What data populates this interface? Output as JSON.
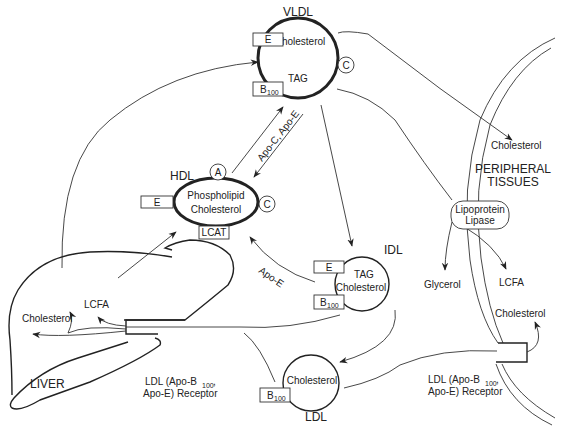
{
  "vldl": {
    "title": "VLDL",
    "content": [
      "Cholesterol",
      "TAG"
    ],
    "apo_boxes": [
      "E",
      "B",
      "100"
    ],
    "apo_circle": "C"
  },
  "hdl": {
    "title": "HDL",
    "content": [
      "Phospholipid",
      "Cholesterol"
    ],
    "apo_box_left": "E",
    "apo_box_bottom": "LCAT",
    "apo_circle_top": "A",
    "apo_circle_right": "C"
  },
  "idl": {
    "title": "IDL",
    "content": [
      "TAG",
      "Cholesterol"
    ],
    "apo_boxes": [
      "E",
      "B",
      "100"
    ]
  },
  "ldl": {
    "title": "LDL",
    "content": "Cholesterol",
    "apo_box": [
      "B",
      "100"
    ]
  },
  "liver": {
    "title": "LIVER",
    "cholesterol": "Cholesterol",
    "lcfa": "LCFA",
    "receptor_line1_a": "LDL (Apo-B",
    "receptor_sub": "100",
    "receptor_line1_b": ",",
    "receptor_line2": "Apo-E) Receptor"
  },
  "peripheral": {
    "title_line1": "PERIPHERAL",
    "title_line2": "TISSUES",
    "cholesterol_top": "Cholesterol",
    "lipase_line1": "Lipoprotein",
    "lipase_line2": "Lipase",
    "glycerol": "Glycerol",
    "lcfa": "LCFA",
    "cholesterol_bottom": "Cholesterol",
    "receptor_line1_a": "LDL (Apo-B",
    "receptor_sub": "100",
    "receptor_line1_b": ",",
    "receptor_line2": "Apo-E) Receptor"
  },
  "arrows": {
    "apo_transfer": "Apo-C, Apo-E",
    "idl_to_hdl": "Apo-E"
  }
}
